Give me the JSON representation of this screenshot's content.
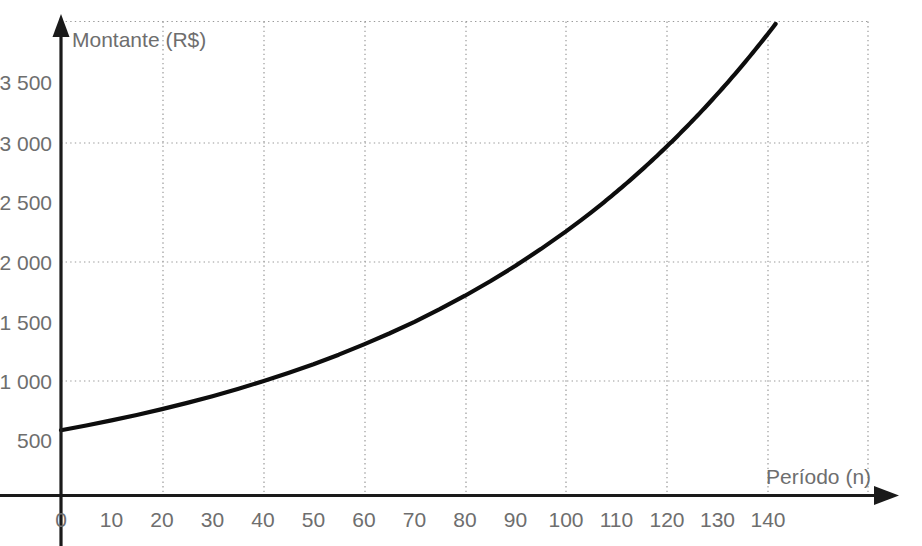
{
  "chart_data": {
    "type": "line",
    "title": "",
    "subtitle": "",
    "xlabel": "Período (n)",
    "ylabel": "Montante (R$)",
    "xlim": [
      0,
      150
    ],
    "ylim": [
      0,
      4000
    ],
    "xticks": [
      0,
      10,
      20,
      30,
      40,
      50,
      60,
      70,
      80,
      90,
      100,
      110,
      120,
      130,
      140
    ],
    "xtick_labels": [
      "0",
      "10",
      "20",
      "30",
      "40",
      "50",
      "60",
      "70",
      "80",
      "90",
      "100",
      "110",
      "120",
      "130",
      "140"
    ],
    "yticks": [
      500,
      1000,
      1500,
      2000,
      2500,
      3000,
      3500
    ],
    "ytick_labels": [
      "500",
      "1 000",
      "1 500",
      "2 000",
      "2 500",
      "3 000",
      "3 500"
    ],
    "grid": true,
    "grid_x_values": [
      20,
      40,
      60,
      80,
      100,
      120,
      140
    ],
    "grid_y_values": [
      1000,
      2000,
      3000,
      4000
    ],
    "legend": null,
    "legend_position": "none",
    "series": [
      {
        "name": "Montante",
        "color": "#0d0d0d",
        "x": [
          0,
          5,
          10,
          15,
          20,
          25,
          30,
          35,
          40,
          45,
          50,
          55,
          60,
          65,
          70,
          75,
          80,
          85,
          90,
          95,
          100,
          103,
          105
        ],
        "values": [
          570,
          611,
          656,
          703,
          754,
          809,
          867,
          930,
          998,
          1070,
          1147,
          1230,
          1320,
          1415,
          1517,
          1627,
          1745,
          1871,
          2006,
          2152,
          2307,
          2405,
          2473
        ]
      }
    ],
    "annotations": []
  },
  "axes": {
    "y_axis_title": "Montante (R$)",
    "x_axis_title": "Período (n)",
    "y_tick_labels": [
      "3 500",
      "3 000",
      "2 500",
      "2 000",
      "1 500",
      "1 000",
      "500"
    ],
    "x_tick_labels": [
      "0",
      "10",
      "20",
      "30",
      "40",
      "50",
      "60",
      "70",
      "80",
      "90",
      "100",
      "110",
      "120",
      "130",
      "140"
    ]
  },
  "colors": {
    "curve": "#0d0d0d",
    "axis": "#1a1a1a",
    "grid": "#9a9a9a",
    "text": "#6e6e6e",
    "background": "#ffffff"
  }
}
